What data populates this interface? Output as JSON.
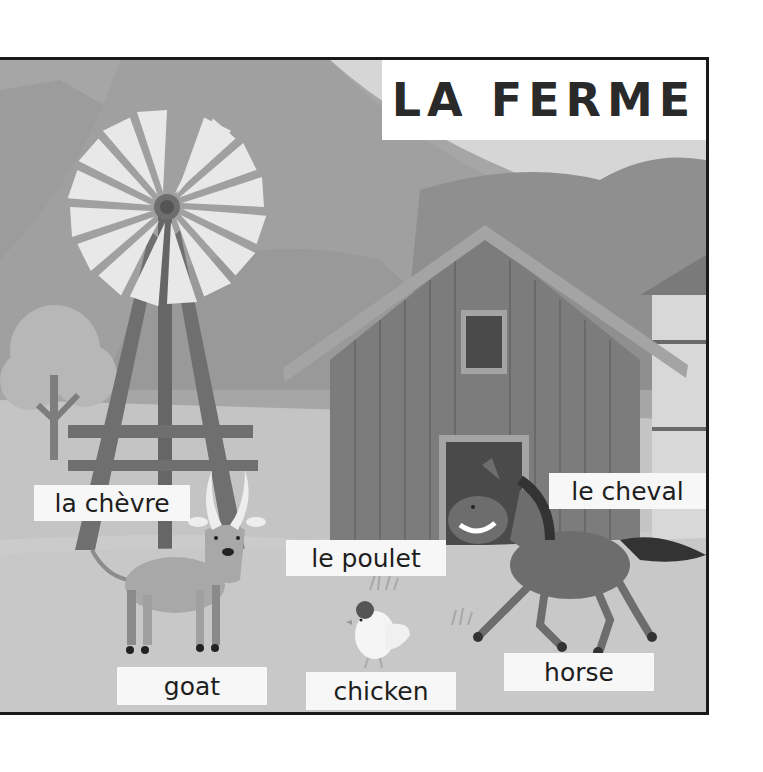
{
  "title": "LA FERME",
  "labels": {
    "goat_fr": "la chèvre",
    "goat_en": "goat",
    "chicken_fr": "le poulet",
    "chicken_en": "chicken",
    "horse_fr": "le cheval",
    "horse_en": "horse"
  },
  "scene": {
    "elements": [
      "mountains",
      "windmill",
      "tree",
      "barn",
      "silo",
      "goat",
      "chicken",
      "horse",
      "grass-tufts"
    ],
    "colors": {
      "sky": "#a9a9a9",
      "mountain_light": "#b8b8b8",
      "mountain_dark": "#9a9a9a",
      "barn": "#777777",
      "ground": "#c9c9c9",
      "label_bg": "#f7f7f7",
      "border": "#1a1a1a"
    }
  }
}
